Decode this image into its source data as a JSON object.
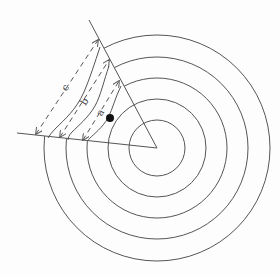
{
  "diagram": {
    "title": "",
    "colors": {
      "stroke": "#555555",
      "dot": "#111111",
      "background": "#fdfdfd"
    },
    "center": {
      "x": 157,
      "y": 148
    },
    "circles": [
      {
        "r": 28
      },
      {
        "r": 49
      },
      {
        "r": 70
      },
      {
        "r": 91
      },
      {
        "r": 113
      }
    ],
    "wedge": {
      "upper_line": {
        "x1": 157,
        "y1": 148,
        "x2": 89,
        "y2": 20
      },
      "left_line": {
        "x1": 157,
        "y1": 148,
        "x2": 17,
        "y2": 133
      }
    },
    "wavy_lines": [
      {
        "name": "outer",
        "d": "M100,47 C95,62 90,78 84,92 C76,110 64,120 56,128 C52,132 49,136 48,138"
      },
      {
        "name": "middle",
        "d": "M109,66 C104,80 101,95 95,106 C88,118 78,126 72,132 C69,135 68,138 68,140"
      },
      {
        "name": "inner",
        "d": "M121,86 C115,98 113,108 108,118 C102,128 94,134 90,138 C89,139 88,140 88,141"
      }
    ],
    "arrows": [
      {
        "label": "c",
        "x1": 36,
        "y1": 134,
        "x2": 98,
        "y2": 40,
        "label_x": 66,
        "label_y": 88
      },
      {
        "label": "b",
        "x1": 60,
        "y1": 137,
        "x2": 109,
        "y2": 60,
        "label_x": 85,
        "label_y": 102
      },
      {
        "label": "a",
        "x1": 83,
        "y1": 140,
        "x2": 119,
        "y2": 81,
        "label_x": 101,
        "label_y": 113
      }
    ],
    "dot": {
      "x": 110,
      "y": 118,
      "r": 4
    }
  }
}
